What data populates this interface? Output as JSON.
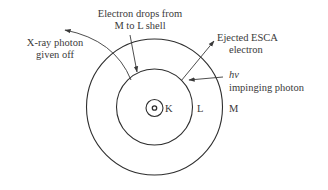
{
  "diagram": {
    "shells": [
      {
        "name": "K",
        "label": "K"
      },
      {
        "name": "L",
        "label": "L"
      },
      {
        "name": "M",
        "label": "M"
      }
    ],
    "labels": {
      "electron_drops_line1": "Electron drops from",
      "electron_drops_line2": "M to L shell",
      "xray_line1": "X-ray photon",
      "xray_line2": "given off",
      "ejected_line1": "Ejected ESCA",
      "ejected_line2": "electron",
      "hv": "hν",
      "impinging": "impinging photon"
    },
    "colors": {
      "line": "#2e2e2e",
      "text": "#3a3a3a",
      "background": "#ffffff"
    }
  }
}
